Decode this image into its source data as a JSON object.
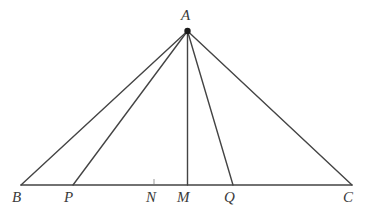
{
  "figure": {
    "type": "euclidean-geometry-diagram",
    "width": 372,
    "height": 216,
    "background_color": "#ffffff",
    "stroke_color": "#444444",
    "label_color": "#3a3a3a",
    "stroke_width": 1.4
  },
  "points": [
    {
      "id": "A",
      "label": "A",
      "x": 187.5,
      "y": 31,
      "marker": "filled-dot",
      "marker_radius": 3.2,
      "label_x": 181,
      "label_y": 8
    },
    {
      "id": "B",
      "label": "B",
      "x": 21,
      "y": 185,
      "marker": "none",
      "label_x": 12,
      "label_y": 190
    },
    {
      "id": "P",
      "label": "P",
      "x": 73,
      "y": 185,
      "marker": "none",
      "label_x": 64,
      "label_y": 190
    },
    {
      "id": "N",
      "label": "N",
      "x": 154,
      "y": 185,
      "marker": "tick",
      "label_x": 146,
      "label_y": 190
    },
    {
      "id": "M",
      "label": "M",
      "x": 187.5,
      "y": 185,
      "marker": "none",
      "label_x": 177,
      "label_y": 190
    },
    {
      "id": "Q",
      "label": "Q",
      "x": 233,
      "y": 185,
      "marker": "none",
      "label_x": 224,
      "label_y": 190
    },
    {
      "id": "C",
      "label": "C",
      "x": 352,
      "y": 185,
      "marker": "none",
      "label_x": 343,
      "label_y": 190
    }
  ],
  "segments": [
    {
      "id": "BC",
      "name": "base-segment-bc",
      "from": "B",
      "to": "C"
    },
    {
      "id": "AB",
      "name": "segment-ab",
      "from": "A",
      "to": "B"
    },
    {
      "id": "AP",
      "name": "cevian-ap",
      "from": "A",
      "to": "P"
    },
    {
      "id": "AM",
      "name": "median-am",
      "from": "A",
      "to": "M"
    },
    {
      "id": "AQ",
      "name": "cevian-aq",
      "from": "A",
      "to": "Q"
    },
    {
      "id": "AC",
      "name": "segment-ac",
      "from": "A",
      "to": "C"
    }
  ],
  "ticks": [
    {
      "id": "N-tick",
      "x": 154,
      "y_top": 179,
      "y_bottom": 184
    }
  ]
}
